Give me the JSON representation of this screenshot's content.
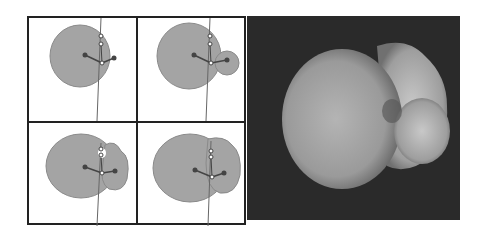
{
  "figure": {
    "left_grid": {
      "panels": [
        {
          "id": "panel-1",
          "lobes": 1
        },
        {
          "id": "panel-2",
          "lobes": 2
        },
        {
          "id": "panel-3",
          "lobes": 2
        },
        {
          "id": "panel-4",
          "lobes": 2
        }
      ]
    },
    "right_image": {
      "description": "grayscale density render"
    },
    "colors": {
      "lobe": "#9a9a9a",
      "frame": "#222222",
      "background_dark": "#2a2a2a"
    }
  }
}
